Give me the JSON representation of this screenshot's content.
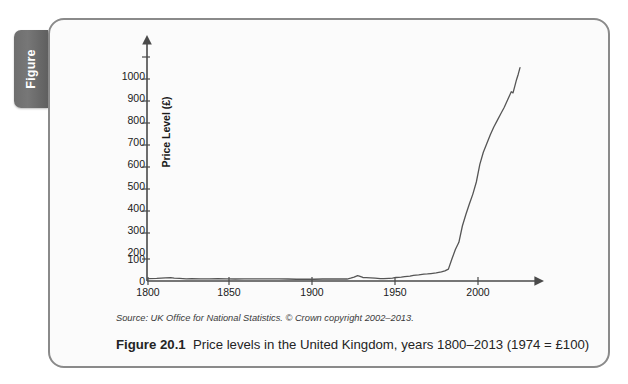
{
  "figure_tab": {
    "label": "Figure"
  },
  "caption": {
    "number": "Figure 20.1",
    "text": "Price levels in the United Kingdom, years 1800–2013 (1974 = £100)",
    "source": "Source: UK Office for National Statistics. © Crown copyright 2002–2013."
  },
  "colors": {
    "card_border": "#8a8a8a",
    "card_background": "#fbfbfb",
    "tab_background": "#6e6e6e",
    "tab_text": "#ffffff",
    "axis": "#4a4a4a",
    "series_line": "#555555",
    "text": "#1a1a1a"
  },
  "chart_data": {
    "type": "line",
    "title": "Price levels in the United Kingdom, years 1800–2013 (1974 = £100)",
    "xlabel": "",
    "ylabel": "Price Level (£)",
    "xlim": [
      1800,
      2013
    ],
    "ylim": [
      0,
      1000
    ],
    "grid": false,
    "legend": null,
    "xticks": [
      1800,
      1850,
      1900,
      1950,
      2000
    ],
    "xtick_labels": [
      "1800",
      "1850",
      "1900",
      "1950",
      "2000"
    ],
    "yticks": [
      0,
      100,
      200,
      300,
      400,
      500,
      600,
      700,
      800,
      900,
      1000
    ],
    "ytick_labels": [
      "0",
      "100",
      "200",
      "300",
      "400",
      "500",
      "600",
      "700",
      "800",
      "900",
      "1000"
    ],
    "series": [
      {
        "name": "UK Price Level (1974 = £100)",
        "x": [
          1800,
          1805,
          1810,
          1813,
          1815,
          1818,
          1820,
          1822,
          1825,
          1830,
          1835,
          1840,
          1845,
          1850,
          1855,
          1860,
          1865,
          1870,
          1875,
          1880,
          1885,
          1890,
          1895,
          1900,
          1905,
          1910,
          1914,
          1916,
          1918,
          1920,
          1921,
          1923,
          1925,
          1930,
          1933,
          1935,
          1938,
          1940,
          1942,
          1945,
          1947,
          1950,
          1952,
          1955,
          1958,
          1960,
          1962,
          1965,
          1968,
          1970,
          1972,
          1974,
          1976,
          1978,
          1980,
          1982,
          1984,
          1986,
          1988,
          1990,
          1992,
          1994,
          1996,
          1998,
          2000,
          2002,
          2004,
          2006,
          2008,
          2009,
          2010,
          2011,
          2012,
          2013
        ],
        "y": [
          11,
          12,
          14,
          15,
          13,
          12,
          11,
          10,
          11,
          10,
          10,
          11,
          10,
          9,
          10,
          10,
          10,
          10,
          10,
          9,
          8,
          8,
          8,
          9,
          9,
          9,
          9,
          13,
          18,
          24,
          22,
          16,
          15,
          13,
          11,
          11,
          12,
          13,
          16,
          18,
          20,
          22,
          26,
          28,
          31,
          32,
          34,
          37,
          41,
          46,
          54,
          100,
          143,
          176,
          250,
          302,
          350,
          395,
          450,
          530,
          585,
          625,
          665,
          700,
          730,
          760,
          790,
          825,
          860,
          855,
          885,
          915,
          940,
          970
        ]
      }
    ]
  }
}
